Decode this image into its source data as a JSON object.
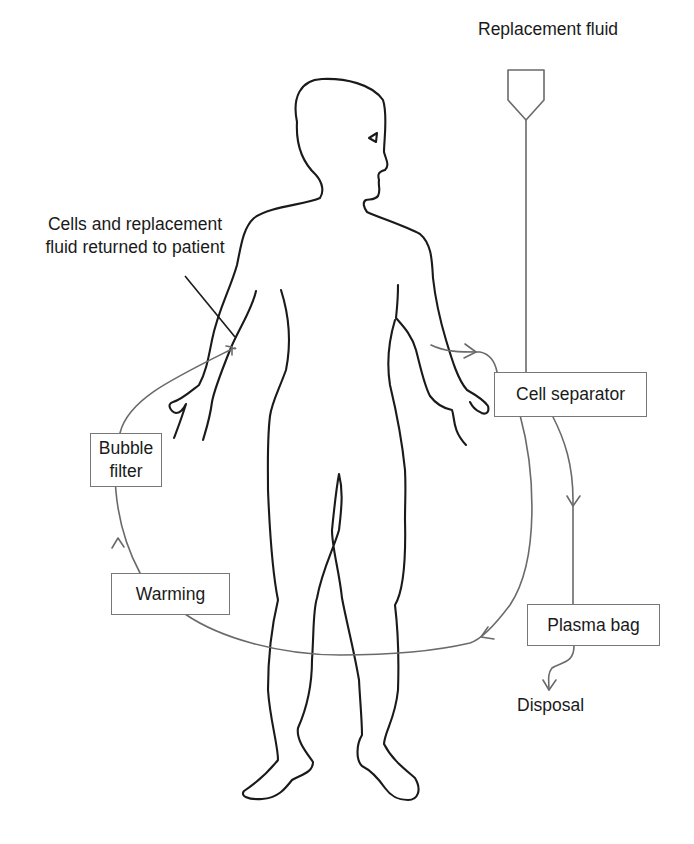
{
  "diagram": {
    "labels": {
      "replacement_fluid": "Replacement fluid",
      "returned": "Cells and replacement\nfluid returned to patient",
      "disposal": "Disposal"
    },
    "boxes": {
      "cell_separator": "Cell separator",
      "bubble_filter": "Bubble\nfilter",
      "warming": "Warming",
      "plasma_bag": "Plasma bag"
    },
    "flow_sequence": [
      "Patient (right arm)",
      "Cell separator",
      "Plasma bag",
      "Disposal"
    ],
    "return_sequence": [
      "Cell separator",
      "Warming",
      "Bubble filter",
      "Patient (left arm)"
    ],
    "inputs": [
      "Replacement fluid → Cell separator"
    ],
    "colors": {
      "outline": "#1a1a1a",
      "flow_line": "#6a6a6a",
      "box_border": "#777777",
      "background": "#ffffff"
    }
  }
}
